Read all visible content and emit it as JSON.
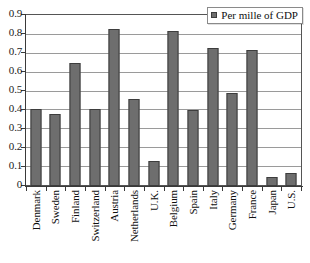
{
  "chart_data": {
    "type": "bar",
    "title": "",
    "subtitle": "",
    "xlabel": "",
    "ylabel": "",
    "ylim": [
      0,
      0.9
    ],
    "ytick_labels": [
      "0.9",
      "0.8",
      "0.7",
      "0.6",
      "0.5",
      "0.4",
      "0.3",
      "0.2",
      "0.1",
      "0"
    ],
    "ytick_values": [
      0.9,
      0.8,
      0.7,
      0.6,
      0.5,
      0.4,
      0.3,
      0.2,
      0.1,
      0
    ],
    "grid": "horizontal",
    "legend_position": "top-right",
    "categories": [
      "Denmark",
      "Sweden",
      "Finland",
      "Switzerland",
      "Austria",
      "Netherlands",
      "U.K.",
      "Belgium",
      "Spain",
      "Italy",
      "Germany",
      "France",
      "Japan",
      "U.S."
    ],
    "values": [
      0.41,
      0.38,
      0.65,
      0.41,
      0.83,
      0.46,
      0.13,
      0.82,
      0.4,
      0.73,
      0.49,
      0.72,
      0.05,
      0.07
    ],
    "series": [
      {
        "name": "Per mille of GDP",
        "values": [
          0.41,
          0.38,
          0.65,
          0.41,
          0.83,
          0.46,
          0.13,
          0.82,
          0.4,
          0.73,
          0.49,
          0.72,
          0.05,
          0.07
        ]
      }
    ]
  },
  "legend": {
    "label": "Per mille of GDP",
    "marker": "square-marker"
  },
  "colors": {
    "bar_fill": "#6e6e6e",
    "bar_stroke": "#3d3d3d",
    "gridline": "#9a9a9a",
    "axis": "#3a3a3a",
    "background": "#ffffff",
    "text": "#101010"
  }
}
